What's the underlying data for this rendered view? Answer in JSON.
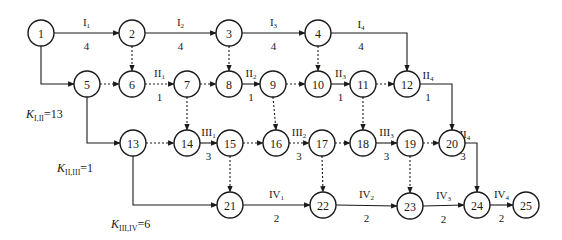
{
  "node_radius": 13,
  "nodes": [
    {
      "id": "1",
      "x": 41,
      "y": 33
    },
    {
      "id": "2",
      "x": 132,
      "y": 33
    },
    {
      "id": "3",
      "x": 229,
      "y": 33
    },
    {
      "id": "4",
      "x": 318,
      "y": 33
    },
    {
      "id": "5",
      "x": 87,
      "y": 84
    },
    {
      "id": "6",
      "x": 132,
      "y": 84
    },
    {
      "id": "7",
      "x": 187,
      "y": 84
    },
    {
      "id": "8",
      "x": 229,
      "y": 84
    },
    {
      "id": "9",
      "x": 273,
      "y": 84
    },
    {
      "id": "10",
      "x": 318,
      "y": 84
    },
    {
      "id": "11",
      "x": 363,
      "y": 84
    },
    {
      "id": "12",
      "x": 407,
      "y": 84
    },
    {
      "id": "13",
      "x": 133,
      "y": 143
    },
    {
      "id": "14",
      "x": 187,
      "y": 143
    },
    {
      "id": "15",
      "x": 230,
      "y": 143
    },
    {
      "id": "16",
      "x": 276,
      "y": 143
    },
    {
      "id": "17",
      "x": 322,
      "y": 143
    },
    {
      "id": "18",
      "x": 363,
      "y": 143
    },
    {
      "id": "19",
      "x": 410,
      "y": 143
    },
    {
      "id": "20",
      "x": 452,
      "y": 143
    },
    {
      "id": "21",
      "x": 230,
      "y": 205
    },
    {
      "id": "22",
      "x": 323,
      "y": 205
    },
    {
      "id": "23",
      "x": 410,
      "y": 206
    },
    {
      "id": "24",
      "x": 477,
      "y": 205
    },
    {
      "id": "25",
      "x": 526,
      "y": 205
    }
  ],
  "edges": [
    {
      "from": "1",
      "to": "2",
      "type": "work",
      "name": "I",
      "sub": "1",
      "duration": "4"
    },
    {
      "from": "2",
      "to": "3",
      "type": "work",
      "name": "I",
      "sub": "2",
      "duration": "4"
    },
    {
      "from": "3",
      "to": "4",
      "type": "work",
      "name": "I",
      "sub": "3",
      "duration": "4"
    },
    {
      "from": "4",
      "to": "12",
      "type": "work",
      "name": "I",
      "sub": "4",
      "duration": "4",
      "route": "hv"
    },
    {
      "from": "1",
      "to": "5",
      "type": "work",
      "route": "vh"
    },
    {
      "from": "2",
      "to": "6",
      "type": "dummy"
    },
    {
      "from": "3",
      "to": "8",
      "type": "dummy"
    },
    {
      "from": "4",
      "to": "10",
      "type": "dummy"
    },
    {
      "from": "5",
      "to": "6",
      "type": "dummy"
    },
    {
      "from": "6",
      "to": "7",
      "type": "dummy",
      "name": "II",
      "sub": "1",
      "duration": "1"
    },
    {
      "from": "7",
      "to": "8",
      "type": "dummy"
    },
    {
      "from": "8",
      "to": "9",
      "type": "work",
      "name": "II",
      "sub": "2",
      "duration": "1"
    },
    {
      "from": "9",
      "to": "10",
      "type": "dummy"
    },
    {
      "from": "10",
      "to": "11",
      "type": "work",
      "name": "II",
      "sub": "3",
      "duration": "1"
    },
    {
      "from": "11",
      "to": "12",
      "type": "dummy"
    },
    {
      "from": "12",
      "to": "20",
      "type": "work",
      "name": "II",
      "sub": "4",
      "duration": "1",
      "route": "hv"
    },
    {
      "from": "7",
      "to": "14",
      "type": "dummy"
    },
    {
      "from": "9",
      "to": "16",
      "type": "dummy"
    },
    {
      "from": "11",
      "to": "18",
      "type": "dummy"
    },
    {
      "from": "5",
      "to": "13",
      "type": "work",
      "route": "vh"
    },
    {
      "from": "13",
      "to": "14",
      "type": "dummy"
    },
    {
      "from": "14",
      "to": "15",
      "type": "work",
      "name": "III",
      "sub": "1",
      "duration": "3"
    },
    {
      "from": "15",
      "to": "16",
      "type": "dummy"
    },
    {
      "from": "16",
      "to": "17",
      "type": "dummy",
      "name": "III",
      "sub": "2",
      "duration": "3"
    },
    {
      "from": "17",
      "to": "18",
      "type": "dummy"
    },
    {
      "from": "18",
      "to": "19",
      "type": "work",
      "name": "III",
      "sub": "3",
      "duration": "3"
    },
    {
      "from": "19",
      "to": "20",
      "type": "dummy"
    },
    {
      "from": "20",
      "to": "24",
      "type": "work",
      "name": "III",
      "sub": "4",
      "duration": "3",
      "route": "hv"
    },
    {
      "from": "15",
      "to": "21",
      "type": "dummy"
    },
    {
      "from": "17",
      "to": "22",
      "type": "dummy"
    },
    {
      "from": "19",
      "to": "23",
      "type": "dummy"
    },
    {
      "from": "13",
      "to": "21",
      "type": "work",
      "route": "vh"
    },
    {
      "from": "21",
      "to": "22",
      "type": "work",
      "name": "IV",
      "sub": "1",
      "duration": "2"
    },
    {
      "from": "22",
      "to": "23",
      "type": "work",
      "name": "IV",
      "sub": "2",
      "duration": "2"
    },
    {
      "from": "23",
      "to": "24",
      "type": "work",
      "name": "IV",
      "sub": "3",
      "duration": "2"
    },
    {
      "from": "24",
      "to": "25",
      "type": "work",
      "name": "IV",
      "sub": "4",
      "duration": "2"
    }
  ],
  "k_labels": [
    {
      "id": "k12",
      "letter": "K",
      "sub": "I,II",
      "value": "=13",
      "x": 26,
      "y": 118
    },
    {
      "id": "k23",
      "letter": "K",
      "sub": "II,III",
      "value": "=1",
      "x": 57,
      "y": 172
    },
    {
      "id": "k34",
      "letter": "K",
      "sub": "III,IV",
      "value": "=6",
      "x": 111,
      "y": 228
    }
  ]
}
